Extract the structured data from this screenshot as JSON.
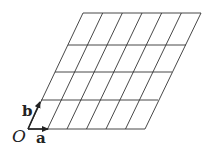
{
  "diagram": {
    "origin_label": "O",
    "vector_a_label": "a",
    "vector_b_label": "b",
    "grid": {
      "columns": 6,
      "rows": 4,
      "row_lines_y": [
        129,
        100,
        72,
        45,
        13
      ],
      "row_left_x": [
        28,
        41,
        55,
        68,
        83
      ],
      "row_right_x": [
        145,
        158,
        172,
        186,
        201
      ]
    },
    "colors": {
      "line": "#333333",
      "background": "#ffffff"
    }
  }
}
